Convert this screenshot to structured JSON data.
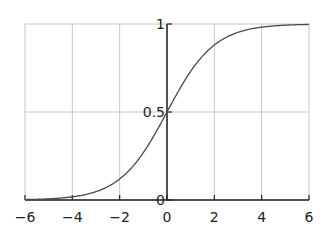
{
  "chart_data": {
    "type": "line",
    "title": "",
    "xlabel": "",
    "ylabel": "",
    "function": "logistic sigmoid 1/(1+e^-x)",
    "xlim": [
      -6,
      6
    ],
    "ylim": [
      0,
      1
    ],
    "grid": true,
    "legend": null,
    "x_ticks": [
      -6,
      -4,
      -2,
      0,
      2,
      4,
      6
    ],
    "x_tick_labels": [
      "−6",
      "−4",
      "−2",
      "0",
      "2",
      "4",
      "6"
    ],
    "y_ticks": [
      0,
      0.5,
      1
    ],
    "y_tick_labels": [
      "0",
      "0.5",
      "1"
    ],
    "series": [
      {
        "name": "sigmoid",
        "x": [
          -6,
          -5,
          -4,
          -3,
          -2,
          -1,
          0,
          1,
          2,
          3,
          4,
          5,
          6
        ],
        "values": [
          0.0025,
          0.0067,
          0.018,
          0.047,
          0.119,
          0.269,
          0.5,
          0.731,
          0.881,
          0.953,
          0.982,
          0.993,
          0.9975
        ]
      }
    ]
  },
  "colors": {
    "curve": "#4a4a4a",
    "grid": "#c8c8c8",
    "axis": "#222222"
  }
}
